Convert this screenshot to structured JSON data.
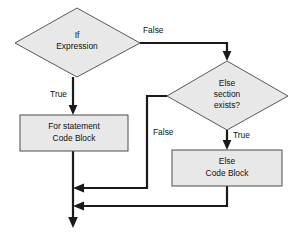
{
  "diagram": {
    "type": "flowchart",
    "background_color": "#ffffff",
    "node_fill_color": "#e8e8e8",
    "node_stroke_color": "#595959",
    "connector_color": "#1a1a1a",
    "nodes": [
      {
        "id": "if-expression",
        "shape": "diamond",
        "line1": "If",
        "line2": "Expression"
      },
      {
        "id": "else-section-exists",
        "shape": "diamond",
        "line1": "Else",
        "line2": "section",
        "line3": "exists?"
      },
      {
        "id": "for-statement-code-block",
        "shape": "rectangle",
        "line1": "For statement",
        "line2": "Code Block"
      },
      {
        "id": "else-code-block",
        "shape": "rectangle",
        "line1": "Else",
        "line2": "Code Block"
      }
    ],
    "edge_labels": {
      "if_false": "False",
      "if_true": "True",
      "else_exists_false": "False",
      "else_exists_true": "True"
    }
  }
}
